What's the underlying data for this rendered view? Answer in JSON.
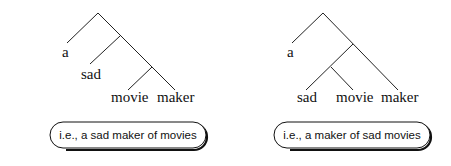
{
  "diagram": {
    "type": "syntax-tree-comparison",
    "trees": [
      {
        "id": "left",
        "leaves": [
          "a",
          "sad",
          "movie",
          "maker"
        ],
        "structure": "[a [sad [movie maker]]]",
        "gloss": "i.e., a sad maker of movies"
      },
      {
        "id": "right",
        "leaves": [
          "a",
          "sad",
          "movie",
          "maker"
        ],
        "structure": "[a [[sad movie] maker]]",
        "gloss": "i.e., a maker of sad movies"
      }
    ]
  }
}
